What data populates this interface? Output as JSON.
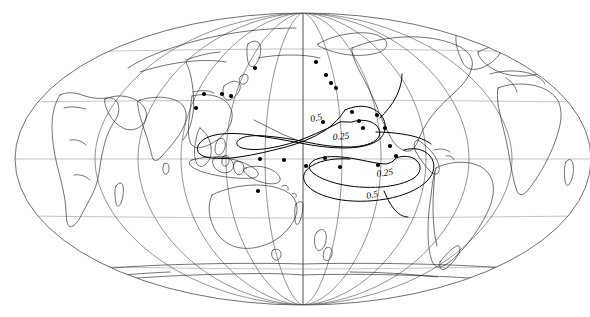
{
  "figure": {
    "kind": "world-map",
    "projection": "mollweide",
    "central_longitude": 180,
    "background_color": "#ffffff",
    "line_color": "#000000",
    "graticule_color": "#5a5a5a"
  },
  "graticule": {
    "meridian_interval_deg": 30,
    "parallel_interval_deg": 30,
    "meridians": [
      -180,
      -150,
      -120,
      -90,
      -60,
      -30,
      0,
      30,
      60,
      90,
      120,
      150,
      180
    ],
    "parallels": [
      60,
      30,
      0,
      -30,
      -60
    ],
    "show_border": true
  },
  "contours": {
    "levels": [
      0.25,
      0.5
    ],
    "labels": [
      {
        "id": "label-05-upper",
        "text": "0.5",
        "x": 311,
        "y": 122,
        "rotation": -12
      },
      {
        "id": "label-025-upper",
        "text": "0.25",
        "x": 333,
        "y": 140,
        "rotation": -5
      },
      {
        "id": "label-025-lower",
        "text": "0.25",
        "x": 377,
        "y": 177,
        "rotation": -8
      },
      {
        "id": "label-05-lower",
        "text": "0.5",
        "x": 367,
        "y": 199,
        "rotation": -12
      }
    ]
  },
  "stations": {
    "marker": "filled-circle",
    "marker_radius_px": 2.1,
    "count": 24,
    "points": [
      {
        "x": 255,
        "y": 68
      },
      {
        "x": 204,
        "y": 94
      },
      {
        "x": 222,
        "y": 94
      },
      {
        "x": 231,
        "y": 96
      },
      {
        "x": 196,
        "y": 108
      },
      {
        "x": 316,
        "y": 62
      },
      {
        "x": 326,
        "y": 75
      },
      {
        "x": 331,
        "y": 83
      },
      {
        "x": 336,
        "y": 88
      },
      {
        "x": 352,
        "y": 112
      },
      {
        "x": 359,
        "y": 121
      },
      {
        "x": 363,
        "y": 128
      },
      {
        "x": 377,
        "y": 115
      },
      {
        "x": 385,
        "y": 128
      },
      {
        "x": 390,
        "y": 146
      },
      {
        "x": 323,
        "y": 122
      },
      {
        "x": 325,
        "y": 158
      },
      {
        "x": 260,
        "y": 159
      },
      {
        "x": 284,
        "y": 160
      },
      {
        "x": 306,
        "y": 166
      },
      {
        "x": 340,
        "y": 167
      },
      {
        "x": 378,
        "y": 165
      },
      {
        "x": 396,
        "y": 156
      },
      {
        "x": 258,
        "y": 191
      }
    ]
  }
}
